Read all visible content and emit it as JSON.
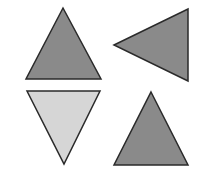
{
  "figure": {
    "width": 201,
    "height": 181,
    "background": "#ffffff",
    "stroke_color": "#2a2a2a",
    "shapes": [
      {
        "id": "triangle-top-left",
        "orientation": "up",
        "fill": "#8a8a8a",
        "points": "63,8 101,79 26,79"
      },
      {
        "id": "triangle-top-right",
        "orientation": "left",
        "fill": "#8a8a8a",
        "points": "114,45 188,9 188,81"
      },
      {
        "id": "triangle-bottom-left",
        "orientation": "down",
        "fill": "#d6d6d6",
        "points": "27,91 100,91 64,164"
      },
      {
        "id": "triangle-bottom-right",
        "orientation": "up",
        "fill": "#8a8a8a",
        "points": "151,92 188,165 114,165"
      }
    ]
  }
}
